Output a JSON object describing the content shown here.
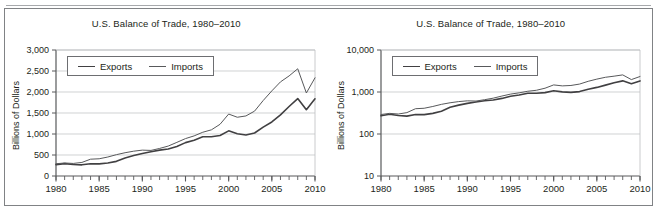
{
  "figure": {
    "top_partial_text": "",
    "frame_color": "#808285",
    "background": "#ffffff"
  },
  "panels": [
    {
      "id": "linear-panel",
      "scale_label": "linear",
      "title": "U.S. Balance of Trade, 1980–2010",
      "ylabel": "Billions of Dollars",
      "ytick_labels": [
        "3,000",
        "2,500",
        "2,000",
        "1,500",
        "1,000",
        "500",
        "0"
      ],
      "xtick_labels": [
        "1980",
        "1985",
        "1990",
        "1995",
        "2000",
        "2005",
        "2010"
      ],
      "legend": {
        "exports": "Exports",
        "imports": "Imports"
      }
    },
    {
      "id": "log-panel",
      "scale_label": "log",
      "title": "U.S. Balance of Trade, 1980–2010",
      "ylabel": "Billions of Dollars",
      "ytick_labels": [
        "10,000",
        "1,000",
        "100",
        "10"
      ],
      "xtick_labels": [
        "1980",
        "1985",
        "1990",
        "1995",
        "2000",
        "2005",
        "2010"
      ],
      "legend": {
        "exports": "Exports",
        "imports": "Imports"
      }
    }
  ],
  "chart_data": [
    {
      "type": "line",
      "title": "U.S. Balance of Trade, 1980–2010",
      "xlabel": "",
      "ylabel": "Billions of Dollars",
      "yscale": "linear",
      "ylim": [
        0,
        3000
      ],
      "xlim": [
        1980,
        2010
      ],
      "yticks": [
        0,
        500,
        1000,
        1500,
        2000,
        2500,
        3000
      ],
      "ytick_labels": [
        "0",
        "500",
        "1,000",
        "1,500",
        "2,000",
        "2,500",
        "3,000"
      ],
      "xticks": [
        1980,
        1985,
        1990,
        1995,
        2000,
        2005,
        2010
      ],
      "xtick_labels": [
        "1980",
        "1985",
        "1990",
        "1995",
        "2000",
        "2005",
        "2010"
      ],
      "minor_xticks_every": 1,
      "grid": "horizontal",
      "legend_position": "upper-left-inside",
      "x": [
        1980,
        1981,
        1982,
        1983,
        1984,
        1985,
        1986,
        1987,
        1988,
        1989,
        1990,
        1991,
        1992,
        1993,
        1994,
        1995,
        1996,
        1997,
        1998,
        1999,
        2000,
        2001,
        2002,
        2003,
        2004,
        2005,
        2006,
        2007,
        2008,
        2009,
        2010
      ],
      "series": [
        {
          "name": "Exports",
          "values": [
            272,
            294,
            275,
            266,
            291,
            289,
            310,
            349,
            431,
            487,
            536,
            578,
            617,
            643,
            704,
            795,
            852,
            936,
            933,
            966,
            1075,
            1006,
            978,
            1023,
            1163,
            1287,
            1457,
            1654,
            1843,
            1578,
            1838
          ]
        },
        {
          "name": "Imports",
          "values": [
            291,
            310,
            299,
            323,
            400,
            410,
            452,
            508,
            554,
            591,
            616,
            609,
            656,
            713,
            801,
            891,
            955,
            1042,
            1099,
            1231,
            1475,
            1399,
            1430,
            1545,
            1797,
            2027,
            2241,
            2383,
            2553,
            1976,
            2338
          ]
        }
      ]
    },
    {
      "type": "line",
      "title": "U.S. Balance of Trade, 1980–2010",
      "xlabel": "",
      "ylabel": "Billions of Dollars",
      "yscale": "log",
      "ylim": [
        10,
        10000
      ],
      "xlim": [
        1980,
        2010
      ],
      "yticks": [
        10,
        100,
        1000,
        10000
      ],
      "ytick_labels": [
        "10",
        "100",
        "1,000",
        "10,000"
      ],
      "xticks": [
        1980,
        1985,
        1990,
        1995,
        2000,
        2005,
        2010
      ],
      "xtick_labels": [
        "1980",
        "1985",
        "1990",
        "1995",
        "2000",
        "2005",
        "2010"
      ],
      "minor_xticks_every": 1,
      "grid": "horizontal",
      "legend_position": "upper-left-inside",
      "x": [
        1980,
        1981,
        1982,
        1983,
        1984,
        1985,
        1986,
        1987,
        1988,
        1989,
        1990,
        1991,
        1992,
        1993,
        1994,
        1995,
        1996,
        1997,
        1998,
        1999,
        2000,
        2001,
        2002,
        2003,
        2004,
        2005,
        2006,
        2007,
        2008,
        2009,
        2010
      ],
      "series": [
        {
          "name": "Exports",
          "values": [
            272,
            294,
            275,
            266,
            291,
            289,
            310,
            349,
            431,
            487,
            536,
            578,
            617,
            643,
            704,
            795,
            852,
            936,
            933,
            966,
            1075,
            1006,
            978,
            1023,
            1163,
            1287,
            1457,
            1654,
            1843,
            1578,
            1838
          ]
        },
        {
          "name": "Imports",
          "values": [
            291,
            310,
            299,
            323,
            400,
            410,
            452,
            508,
            554,
            591,
            616,
            609,
            656,
            713,
            801,
            891,
            955,
            1042,
            1099,
            1231,
            1475,
            1399,
            1430,
            1545,
            1797,
            2027,
            2241,
            2383,
            2553,
            1976,
            2338
          ]
        }
      ]
    }
  ]
}
